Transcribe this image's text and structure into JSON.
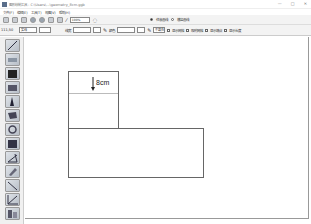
{
  "window": {
    "title": "图形绘制工具 - C:\\Users\\...\\geometry_8cm.ggb",
    "controls": [
      "—",
      "□",
      "✕"
    ]
  },
  "menubar": {
    "items": [
      "文件(F)",
      "编辑(E)",
      "工具(T)",
      "视图(V)",
      "帮助(H)"
    ]
  },
  "toolbar1": {
    "zoom_value": "100%",
    "radio_options": [
      {
        "label": "任意画线",
        "checked": true
      },
      {
        "label": "横竖画线",
        "checked": false
      }
    ]
  },
  "toolbar2": {
    "coordinates": "111,50",
    "style_select": "实线",
    "width_label": "线宽",
    "color_label": "颜色",
    "fill_select": "不填充",
    "checkboxes": [
      {
        "label": "显示网格",
        "checked": false
      },
      {
        "label": "吸附网格",
        "checked": false
      },
      {
        "label": "显示端点",
        "checked": false
      },
      {
        "label": "显示长度",
        "checked": false
      }
    ]
  },
  "left_tools": [
    {
      "name": "line-tool"
    },
    {
      "name": "eraser-tool"
    },
    {
      "name": "fill-tool"
    },
    {
      "name": "rectangle-tool"
    },
    {
      "name": "triangle-tool"
    },
    {
      "name": "polygon-tool"
    },
    {
      "name": "circle-tool"
    },
    {
      "name": "cube-tool"
    },
    {
      "name": "angle-tool"
    },
    {
      "name": "ruler-tool"
    },
    {
      "name": "diagonal-tool"
    },
    {
      "name": "axis-tool"
    },
    {
      "name": "text-tool"
    }
  ],
  "canvas": {
    "measure_label": "8cm",
    "stroke_color": "#666666"
  }
}
